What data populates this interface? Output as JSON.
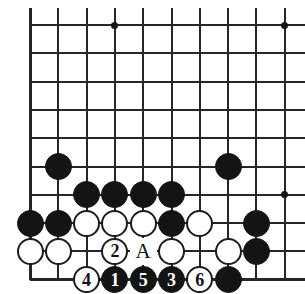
{
  "diagram": {
    "type": "go-board-diagram",
    "title": "",
    "board": {
      "origin_x": 30,
      "origin_y": 25,
      "spacing": 28.3,
      "columns": 10,
      "rows": 9,
      "left_edge": true,
      "bottom_edge": true,
      "top_edge": false,
      "right_edge": false,
      "line_color": "#262626",
      "background": "#ffffff"
    },
    "star_points": [
      {
        "col": 3,
        "row": 0
      },
      {
        "col": 9,
        "row": 0
      },
      {
        "col": 9,
        "row": 6
      }
    ],
    "stones": [
      {
        "col": 1,
        "row": 5,
        "color": "black",
        "label": ""
      },
      {
        "col": 7,
        "row": 5,
        "color": "black",
        "label": ""
      },
      {
        "col": 2,
        "row": 6,
        "color": "black",
        "label": ""
      },
      {
        "col": 3,
        "row": 6,
        "color": "black",
        "label": ""
      },
      {
        "col": 4,
        "row": 6,
        "color": "black",
        "label": ""
      },
      {
        "col": 5,
        "row": 6,
        "color": "black",
        "label": ""
      },
      {
        "col": 0,
        "row": 7,
        "color": "black",
        "label": ""
      },
      {
        "col": 1,
        "row": 7,
        "color": "black",
        "label": ""
      },
      {
        "col": 2,
        "row": 7,
        "color": "white",
        "label": ""
      },
      {
        "col": 3,
        "row": 7,
        "color": "white",
        "label": ""
      },
      {
        "col": 4,
        "row": 7,
        "color": "white",
        "label": ""
      },
      {
        "col": 5,
        "row": 7,
        "color": "black",
        "label": ""
      },
      {
        "col": 6,
        "row": 7,
        "color": "white",
        "label": ""
      },
      {
        "col": 8,
        "row": 7,
        "color": "black",
        "label": ""
      },
      {
        "col": 0,
        "row": 8,
        "color": "white",
        "label": ""
      },
      {
        "col": 1,
        "row": 8,
        "color": "white",
        "label": ""
      },
      {
        "col": 3,
        "row": 8,
        "color": "white",
        "label": "2"
      },
      {
        "col": 5,
        "row": 8,
        "color": "white",
        "label": ""
      },
      {
        "col": 7,
        "row": 8,
        "color": "white",
        "label": ""
      },
      {
        "col": 8,
        "row": 8,
        "color": "black",
        "label": ""
      },
      {
        "col": 2,
        "row": 9,
        "color": "white",
        "label": "4"
      },
      {
        "col": 3,
        "row": 9,
        "color": "black",
        "label": "1"
      },
      {
        "col": 4,
        "row": 9,
        "color": "black",
        "label": "5"
      },
      {
        "col": 5,
        "row": 9,
        "color": "black",
        "label": "3"
      },
      {
        "col": 6,
        "row": 9,
        "color": "white",
        "label": "6"
      },
      {
        "col": 7,
        "row": 9,
        "color": "black",
        "label": ""
      }
    ],
    "point_labels": [
      {
        "col": 4,
        "row": 8,
        "text": "A"
      }
    ],
    "move_sequence": [
      {
        "number": "1",
        "color": "black"
      },
      {
        "number": "2",
        "color": "white"
      },
      {
        "number": "3",
        "color": "black"
      },
      {
        "number": "4",
        "color": "white"
      },
      {
        "number": "5",
        "color": "black"
      },
      {
        "number": "6",
        "color": "white"
      }
    ]
  }
}
